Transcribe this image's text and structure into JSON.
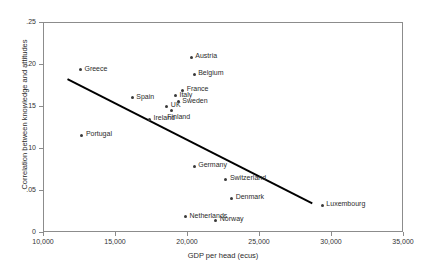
{
  "chart_data": {
    "type": "scatter",
    "title": "",
    "xlabel": "GDP per head (ecus)",
    "ylabel": "Correlation between knowledge and attitudes",
    "xlim": [
      10000,
      35000
    ],
    "ylim": [
      0,
      0.25
    ],
    "xticks": [
      10000,
      15000,
      20000,
      25000,
      30000,
      35000
    ],
    "xtick_labels": [
      "10,000",
      "15,000",
      "20,000",
      "25,000",
      "30,000",
      "35,000"
    ],
    "yticks": [
      0,
      0.05,
      0.1,
      0.15,
      0.2,
      0.25
    ],
    "ytick_labels": [
      "0",
      ".05",
      ".10",
      ".15",
      ".20",
      ".25"
    ],
    "grid": false,
    "legend": "none",
    "points": [
      {
        "label": "Greece",
        "x": 12600,
        "y": 0.193,
        "label_pos": "right"
      },
      {
        "label": "Portugal",
        "x": 12700,
        "y": 0.115,
        "label_pos": "right"
      },
      {
        "label": "Spain",
        "x": 16200,
        "y": 0.16,
        "label_pos": "right"
      },
      {
        "label": "Ireland",
        "x": 17400,
        "y": 0.134,
        "label_pos": "right"
      },
      {
        "label": "UK",
        "x": 18600,
        "y": 0.15,
        "label_pos": "right"
      },
      {
        "label": "Finland",
        "x": 18900,
        "y": 0.145,
        "label_pos": "below2"
      },
      {
        "label": "Italy",
        "x": 19200,
        "y": 0.162,
        "label_pos": "right"
      },
      {
        "label": "Sweden",
        "x": 19400,
        "y": 0.155,
        "label_pos": "right"
      },
      {
        "label": "France",
        "x": 19700,
        "y": 0.169,
        "label_pos": "right"
      },
      {
        "label": "Netherlands",
        "x": 19900,
        "y": 0.018,
        "label_pos": "right"
      },
      {
        "label": "Austria",
        "x": 20300,
        "y": 0.208,
        "label_pos": "right"
      },
      {
        "label": "Belgium",
        "x": 20500,
        "y": 0.188,
        "label_pos": "right"
      },
      {
        "label": "Germany",
        "x": 20500,
        "y": 0.078,
        "label_pos": "right"
      },
      {
        "label": "Norway",
        "x": 22000,
        "y": 0.014,
        "label_pos": "right"
      },
      {
        "label": "Switzerland",
        "x": 22700,
        "y": 0.063,
        "label_pos": "right"
      },
      {
        "label": "Denmark",
        "x": 23100,
        "y": 0.04,
        "label_pos": "right"
      },
      {
        "label": "Luxembourg",
        "x": 29400,
        "y": 0.032,
        "label_pos": "right"
      }
    ],
    "trendline": {
      "x_start": 11700,
      "y_start": 0.182,
      "x_end": 28700,
      "y_end": 0.034
    },
    "colors": {
      "marker": "#3a3a3a",
      "trendline": "#000000",
      "frame": "#8c8c8c",
      "text": "#2b2b2b",
      "background": "#ffffff"
    }
  }
}
